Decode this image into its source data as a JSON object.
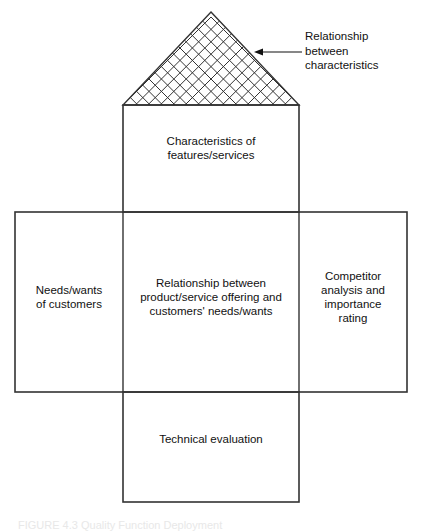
{
  "diagram": {
    "type": "house-of-quality",
    "stroke_color": "#333333",
    "background_color": "#ffffff",
    "text_color": "#111111",
    "roof": {
      "name": "relationship-matrix-roof",
      "grid_pattern": "diagonal-cross-hatch",
      "apex_x": 211,
      "apex_y": 12,
      "base_y": 105,
      "base_left_x": 123,
      "base_right_x": 299,
      "diagonal_spacing": 12.4
    },
    "boxes": {
      "characteristics": {
        "label": "Characteristics of\nfeatures/services",
        "x": 123,
        "y": 105,
        "width": 176,
        "height": 107
      },
      "needs_wants": {
        "label": "Needs/wants\nof customers",
        "x": 15,
        "y": 212,
        "width": 108,
        "height": 180
      },
      "relationship_center": {
        "label": "Relationship between\nproduct/service offering and\ncustomers' needs/wants",
        "x": 123,
        "y": 212,
        "width": 176,
        "height": 180
      },
      "competitor": {
        "label": "Competitor\nanalysis and\nimportance\nrating",
        "x": 299,
        "y": 212,
        "width": 108,
        "height": 180
      },
      "technical_evaluation": {
        "label": "Technical evaluation",
        "x": 123,
        "y": 392,
        "width": 176,
        "height": 110
      }
    },
    "annotation": {
      "label": "Relationship\nbetween\ncharacteristics",
      "text_x": 305,
      "text_y": 29,
      "arrow": {
        "from_x": 302,
        "from_y": 52,
        "to_x": 256,
        "to_y": 52
      }
    },
    "caption": {
      "text": "FIGURE 4.3  Quality Function Deployment"
    }
  }
}
